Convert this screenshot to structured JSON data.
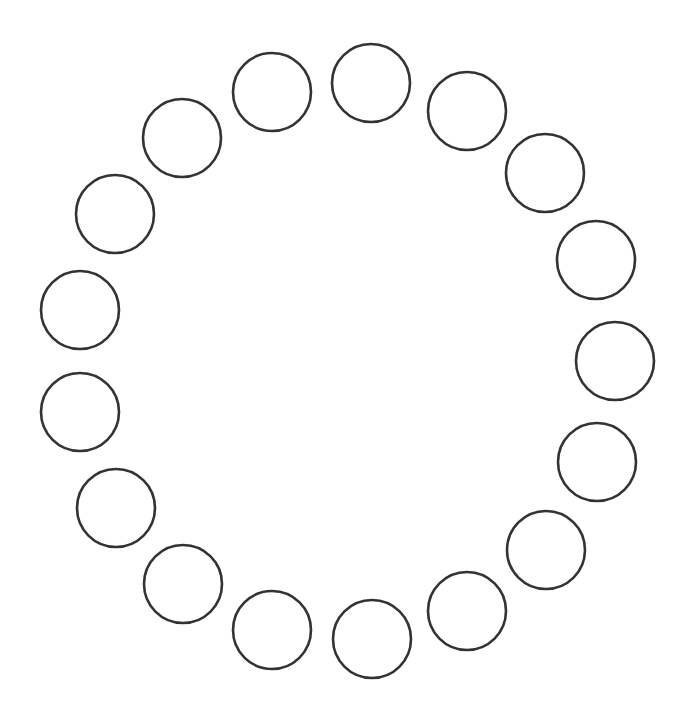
{
  "diagram": {
    "type": "ring-of-circles",
    "background": "#ffffff",
    "stroke_color": "#333333",
    "stroke_width": 2.6,
    "circle_count": 18,
    "circles": [
      {
        "cx": 371,
        "cy": 83,
        "r": 39
      },
      {
        "cx": 467,
        "cy": 111,
        "r": 39
      },
      {
        "cx": 545,
        "cy": 173,
        "r": 39
      },
      {
        "cx": 596,
        "cy": 260,
        "r": 39
      },
      {
        "cx": 615,
        "cy": 361,
        "r": 39
      },
      {
        "cx": 597,
        "cy": 462,
        "r": 39
      },
      {
        "cx": 546,
        "cy": 550,
        "r": 39
      },
      {
        "cx": 467,
        "cy": 611,
        "r": 39
      },
      {
        "cx": 372,
        "cy": 639,
        "r": 39
      },
      {
        "cx": 272,
        "cy": 630,
        "r": 39
      },
      {
        "cx": 183,
        "cy": 584,
        "r": 39
      },
      {
        "cx": 116,
        "cy": 508,
        "r": 39
      },
      {
        "cx": 80,
        "cy": 412,
        "r": 39
      },
      {
        "cx": 80,
        "cy": 310,
        "r": 39
      },
      {
        "cx": 115,
        "cy": 214,
        "r": 39
      },
      {
        "cx": 182,
        "cy": 138,
        "r": 39
      },
      {
        "cx": 272,
        "cy": 92,
        "r": 39
      }
    ]
  }
}
